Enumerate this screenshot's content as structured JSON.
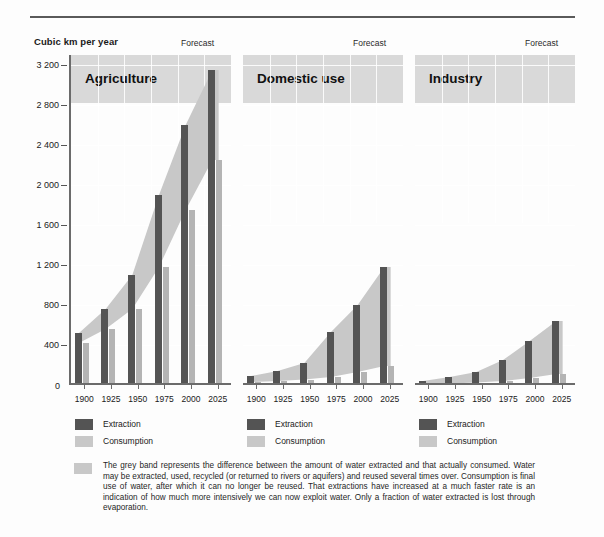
{
  "header": {
    "axis_title": "Cubic km per year",
    "forecast_label": "Forecast"
  },
  "legend": {
    "extraction_label": "Extraction",
    "consumption_label": "Consumption",
    "extraction_color": "#545454",
    "consumption_color": "#c8c8c8"
  },
  "footnote": {
    "text": "The grey band represents the difference between the amount of water extracted and that actually consumed. Water may be extracted, used, recycled (or returned to rivers or aquifers) and reused several times over. Consumption is final use of water, after which it can no longer be reused. That extractions have increased at a much faster rate is an indication of how much more intensively we can now exploit water. Only a fraction of water extracted is lost through evaporation."
  },
  "chart_data": {
    "type": "bar",
    "title": "Cubic km per year",
    "xlabel": "",
    "ylabel": "Cubic km per year",
    "ylim": [
      0,
      3300
    ],
    "yticks": [
      400,
      800,
      1200,
      1600,
      2000,
      2400,
      2800,
      3200
    ],
    "ytick_labels": [
      "400",
      "800",
      "1 200",
      "1 600",
      "2 000",
      "2 400",
      "2 800",
      "3 200"
    ],
    "zero_label": "0",
    "grid": true,
    "legend_position": "below",
    "categories": [
      "1900",
      "1925",
      "1950",
      "1975",
      "2000",
      "2025"
    ],
    "annotations": [
      "Forecast"
    ],
    "panels": [
      {
        "name": "Agriculture",
        "series": [
          {
            "name": "Extraction",
            "values": [
              520,
              760,
              1100,
              1900,
              2600,
              3150
            ]
          },
          {
            "name": "Consumption",
            "values": [
              420,
              560,
              760,
              1180,
              1750,
              2250
            ]
          }
        ]
      },
      {
        "name": "Domestic use",
        "series": [
          {
            "name": "Extraction",
            "values": [
              90,
              140,
              220,
              530,
              800,
              1180
            ]
          },
          {
            "name": "Consumption",
            "values": [
              30,
              40,
              55,
              80,
              130,
              190
            ]
          }
        ]
      },
      {
        "name": "Industry",
        "series": [
          {
            "name": "Extraction",
            "values": [
              40,
              80,
              130,
              250,
              440,
              640
            ]
          },
          {
            "name": "Consumption",
            "values": [
              10,
              15,
              25,
              40,
              70,
              110
            ]
          }
        ]
      }
    ]
  }
}
